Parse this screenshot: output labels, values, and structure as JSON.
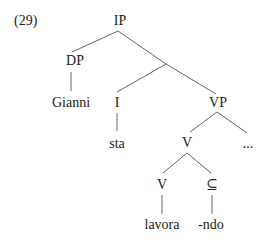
{
  "example": {
    "number": "(29)",
    "nodes": {
      "ip": "IP",
      "dp": "DP",
      "gianni": "Gianni",
      "i": "I",
      "vp": "VP",
      "sta": "sta",
      "v_upper": "V",
      "ellipsis": "...",
      "v_lower": "V",
      "subset": "⊆",
      "lavora": "lavora",
      "ndo": "-ndo"
    }
  }
}
